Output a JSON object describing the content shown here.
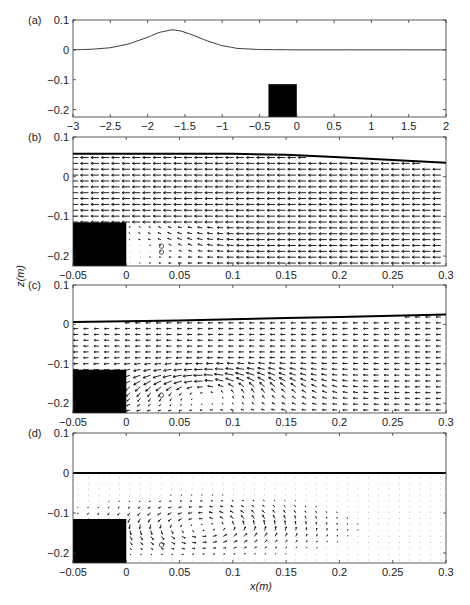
{
  "figure": {
    "width": 470,
    "height": 605,
    "xlabel": "x(m)",
    "ylabel": "z(m)"
  },
  "chart_data": [
    {
      "type": "line",
      "panel": "(a)",
      "title": "",
      "xlabel": "",
      "ylabel": "",
      "xlim": [
        -3,
        2
      ],
      "ylim": [
        -0.225,
        0.1
      ],
      "xticks": [
        -3,
        -2.5,
        -2,
        -1.5,
        -1,
        -0.5,
        0,
        0.5,
        1,
        1.5,
        2
      ],
      "xtick_labels": [
        "-3",
        "-2.5",
        "-2",
        "-1.5",
        "-1",
        "-0.5",
        "0",
        "0.5",
        "1",
        "1.5",
        "2"
      ],
      "yticks": [
        0.1,
        0,
        -0.1,
        -0.2
      ],
      "ytick_labels": [
        "0.1",
        "0",
        "-0.1",
        "-0.2"
      ],
      "grid": false,
      "series": [
        {
          "name": "free surface (solitary wave)",
          "x": [
            -3,
            -2.75,
            -2.5,
            -2.25,
            -2.0,
            -1.85,
            -1.7,
            -1.65,
            -1.55,
            -1.4,
            -1.2,
            -1.0,
            -0.8,
            -0.5,
            0,
            0.5,
            1,
            1.5,
            2
          ],
          "y": [
            0.0,
            0.002,
            0.007,
            0.02,
            0.042,
            0.058,
            0.066,
            0.067,
            0.063,
            0.05,
            0.03,
            0.014,
            0.005,
            0.001,
            0.0,
            0.0,
            0.0,
            0.0,
            0.0
          ]
        }
      ],
      "obstacle": {
        "x0": -0.38,
        "x1": 0,
        "ytop": -0.115
      },
      "frame": {
        "left": 73,
        "top": 20,
        "right": 446,
        "bottom": 117
      }
    },
    {
      "type": "quiver",
      "panel": "(b)",
      "xlim": [
        -0.05,
        0.3
      ],
      "ylim": [
        -0.225,
        0.1
      ],
      "xticks": [
        -0.05,
        0,
        0.05,
        0.1,
        0.15,
        0.2,
        0.25,
        0.3
      ],
      "xtick_labels": [
        "-0.05",
        "0",
        "0.05",
        "0.1",
        "0.15",
        "0.2",
        "0.25",
        "0.3"
      ],
      "yticks": [
        0.1,
        0,
        -0.1,
        -0.2
      ],
      "ytick_labels": [
        "0.1",
        "0",
        "-0.1",
        "-0.2"
      ],
      "surface": {
        "x": [
          -0.05,
          0.1,
          0.15,
          0.2,
          0.25,
          0.3
        ],
        "y": [
          0.058,
          0.058,
          0.055,
          0.049,
          0.042,
          0.035
        ]
      },
      "obstacle": {
        "x0": -0.05,
        "x1": 0,
        "ytop": -0.115
      },
      "flow": {
        "u": -1.0,
        "vortex": {
          "cx": 0.03,
          "cy": -0.17,
          "strength": 0.25,
          "radius": 0.03
        },
        "jet_from_corner": true
      },
      "markers": [
        {
          "x": 0.033,
          "y": -0.175
        },
        {
          "x": 0.033,
          "y": -0.19
        }
      ],
      "frame": {
        "left": 73,
        "top": 137,
        "right": 446,
        "bottom": 266
      }
    },
    {
      "type": "quiver",
      "panel": "(c)",
      "xlim": [
        -0.05,
        0.3
      ],
      "ylim": [
        -0.225,
        0.1
      ],
      "xticks": [
        -0.05,
        0,
        0.05,
        0.1,
        0.15,
        0.2,
        0.25,
        0.3
      ],
      "xtick_labels": [
        "-0.05",
        "0",
        "0.05",
        "0.1",
        "0.15",
        "0.2",
        "0.25",
        "0.3"
      ],
      "yticks": [
        0.1,
        0,
        -0.1,
        -0.2
      ],
      "ytick_labels": [
        "0.1",
        "0",
        "-0.1",
        "-0.2"
      ],
      "surface": {
        "x": [
          -0.05,
          0.05,
          0.1,
          0.15,
          0.2,
          0.25,
          0.3
        ],
        "y": [
          0.006,
          0.01,
          0.013,
          0.016,
          0.019,
          0.022,
          0.025
        ]
      },
      "obstacle": {
        "x0": -0.05,
        "x1": 0,
        "ytop": -0.115
      },
      "flow": {
        "u": -0.6,
        "vortex": {
          "cx": 0.075,
          "cy": -0.16,
          "strength": 1.0,
          "radius": 0.055
        }
      },
      "markers": [
        {
          "x": 0.033,
          "y": -0.18
        }
      ],
      "frame": {
        "left": 73,
        "top": 285,
        "right": 446,
        "bottom": 413
      }
    },
    {
      "type": "quiver",
      "panel": "(d)",
      "xlim": [
        -0.05,
        0.3
      ],
      "ylim": [
        -0.225,
        0.1
      ],
      "xticks": [
        -0.05,
        0,
        0.05,
        0.1,
        0.15,
        0.2,
        0.25,
        0.3
      ],
      "xtick_labels": [
        "-0.05",
        "0",
        "0.05",
        "0.1",
        "0.15",
        "0.2",
        "0.25",
        "0.3"
      ],
      "yticks": [
        0.1,
        0,
        -0.1,
        -0.2
      ],
      "ytick_labels": [
        "0.1",
        "0",
        "-0.1",
        "-0.2"
      ],
      "surface": {
        "x": [
          -0.05,
          0.3
        ],
        "y": [
          0.0,
          0.0
        ]
      },
      "obstacle": {
        "x0": -0.05,
        "x1": 0,
        "ytop": -0.115
      },
      "flow": {
        "u": 0.0,
        "vortex": {
          "cx": 0.07,
          "cy": -0.135,
          "strength": 1.0,
          "radius": 0.06
        }
      },
      "markers": [
        {
          "x": 0.033,
          "y": -0.18
        }
      ],
      "frame": {
        "left": 73,
        "top": 433,
        "right": 446,
        "bottom": 563
      }
    }
  ]
}
